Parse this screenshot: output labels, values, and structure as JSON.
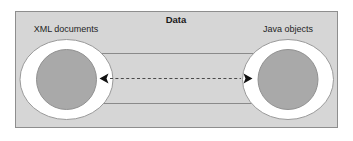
{
  "diagram": {
    "title": "Data",
    "nodes": [
      {
        "id": "xml",
        "label": "XML documents"
      },
      {
        "id": "java",
        "label": "Java objects"
      }
    ],
    "connectors": [
      {
        "id": "top-line",
        "style": "solid",
        "direction": "none"
      },
      {
        "id": "middle-arrow",
        "style": "dashed",
        "direction": "bidirectional",
        "left_marker": "<",
        "right_marker": ">"
      },
      {
        "id": "bottom-line",
        "style": "solid",
        "direction": "none"
      }
    ],
    "colors": {
      "panel_background": "#d6d6d6",
      "panel_border": "#8e8e8e",
      "outer_ellipse_fill": "#ffffff",
      "outer_ellipse_stroke": "#9a9a9a",
      "inner_circle_fill": "#a9a9a9",
      "inner_circle_stroke": "#919191",
      "line_color": "#8a8a8a",
      "dashed_line_color": "#4a4a4a",
      "arrow_color": "#111111",
      "text_color": "#1a1a1a",
      "page_background": "#ffffff"
    }
  }
}
